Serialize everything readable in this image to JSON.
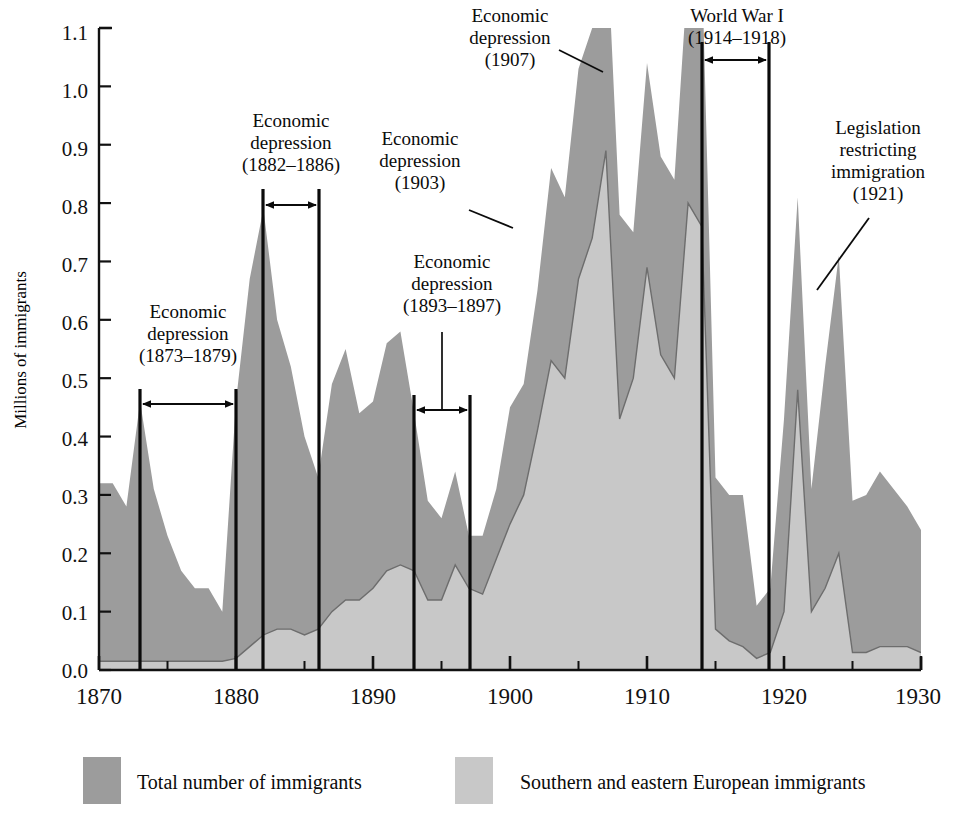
{
  "chart_data": {
    "type": "area",
    "title": "",
    "xlabel": "",
    "ylabel": "Millions of immigrants",
    "xlim": [
      1870,
      1930
    ],
    "ylim": [
      0.0,
      1.1
    ],
    "grid": false,
    "legend_position": "bottom",
    "y_ticks": [
      "0.0",
      "0.1",
      "0.2",
      "0.3",
      "0.4",
      "0.5",
      "0.6",
      "0.7",
      "0.8",
      "0.9",
      "1.0",
      "1.1"
    ],
    "x_ticks": [
      "1870",
      "1880",
      "1890",
      "1900",
      "1910",
      "1920",
      "1930"
    ],
    "x_minor_tick_interval": 5,
    "x": [
      1870,
      1871,
      1872,
      1873,
      1874,
      1875,
      1876,
      1877,
      1878,
      1879,
      1880,
      1881,
      1882,
      1883,
      1884,
      1885,
      1886,
      1887,
      1888,
      1889,
      1890,
      1891,
      1892,
      1893,
      1894,
      1895,
      1896,
      1897,
      1898,
      1899,
      1900,
      1901,
      1902,
      1903,
      1904,
      1905,
      1906,
      1907,
      1908,
      1909,
      1910,
      1911,
      1912,
      1913,
      1914,
      1915,
      1916,
      1917,
      1918,
      1919,
      1920,
      1921,
      1922,
      1923,
      1924,
      1925,
      1926,
      1927,
      1928,
      1929,
      1930
    ],
    "series": [
      {
        "name": "Total number of immigrants",
        "color": "#9c9c9c",
        "values": [
          0.32,
          0.32,
          0.28,
          0.46,
          0.31,
          0.23,
          0.17,
          0.14,
          0.14,
          0.1,
          0.46,
          0.67,
          0.79,
          0.6,
          0.52,
          0.4,
          0.33,
          0.49,
          0.55,
          0.44,
          0.46,
          0.56,
          0.58,
          0.44,
          0.29,
          0.26,
          0.34,
          0.23,
          0.23,
          0.31,
          0.45,
          0.49,
          0.65,
          0.86,
          0.81,
          1.03,
          1.1,
          1.29,
          0.78,
          0.75,
          1.04,
          0.88,
          0.84,
          1.2,
          1.22,
          0.33,
          0.3,
          0.3,
          0.11,
          0.14,
          0.43,
          0.81,
          0.31,
          0.52,
          0.71,
          0.29,
          0.3,
          0.34,
          0.31,
          0.28,
          0.24
        ]
      },
      {
        "name": "Southern and eastern European immigrants",
        "color": "#c8c8c8",
        "values": [
          0.015,
          0.015,
          0.015,
          0.015,
          0.015,
          0.015,
          0.015,
          0.015,
          0.015,
          0.015,
          0.02,
          0.04,
          0.06,
          0.07,
          0.07,
          0.06,
          0.07,
          0.1,
          0.12,
          0.12,
          0.14,
          0.17,
          0.18,
          0.17,
          0.12,
          0.12,
          0.18,
          0.14,
          0.13,
          0.19,
          0.25,
          0.3,
          0.41,
          0.53,
          0.5,
          0.67,
          0.74,
          0.89,
          0.43,
          0.5,
          0.69,
          0.54,
          0.5,
          0.8,
          0.76,
          0.07,
          0.05,
          0.04,
          0.02,
          0.03,
          0.1,
          0.48,
          0.1,
          0.14,
          0.2,
          0.03,
          0.03,
          0.04,
          0.04,
          0.04,
          0.03
        ]
      }
    ],
    "annotations": [
      {
        "id": "depression-1873-1879",
        "lines": [
          "Economic",
          "depression",
          "(1873–1879)"
        ],
        "marker": "span-arrow",
        "span_start": 1873,
        "span_end": 1879,
        "span_top": 0.5
      },
      {
        "id": "depression-1882-1886",
        "lines": [
          "Economic",
          "depression",
          "(1882–1886)"
        ],
        "marker": "span-arrow",
        "span_start": 1882,
        "span_end": 1886,
        "span_top": 0.845
      },
      {
        "id": "depression-1893-1897",
        "lines": [
          "Economic",
          "depression",
          "(1893–1897)"
        ],
        "marker": "span-arrow",
        "span_start": 1893,
        "span_end": 1897,
        "span_top": 0.49
      },
      {
        "id": "depression-1903",
        "lines": [
          "Economic",
          "depression",
          "(1903)"
        ],
        "marker": "leader-line",
        "point_year": 1903
      },
      {
        "id": "depression-1907",
        "lines": [
          "Economic",
          "depression",
          "(1907)"
        ],
        "marker": "leader-line",
        "point_year": 1907
      },
      {
        "id": "world-war-i",
        "lines": [
          "World War I",
          "(1914–1918)"
        ],
        "marker": "span-arrow",
        "span_start": 1914,
        "span_end": 1918,
        "span_top": 1.035
      },
      {
        "id": "legislation-1921",
        "lines": [
          "Legislation",
          "restricting",
          "immigration",
          "(1921)"
        ],
        "marker": "leader-line",
        "point_year": 1921
      }
    ]
  },
  "axis": {
    "y_title": "Millions of immigrants",
    "y_tick_0": "0.0",
    "y_tick_1": "0.1",
    "y_tick_2": "0.2",
    "y_tick_3": "0.3",
    "y_tick_4": "0.4",
    "y_tick_5": "0.5",
    "y_tick_6": "0.6",
    "y_tick_7": "0.7",
    "y_tick_8": "0.8",
    "y_tick_9": "0.9",
    "y_tick_10": "1.0",
    "y_tick_11": "1.1",
    "x_tick_0": "1870",
    "x_tick_1": "1880",
    "x_tick_2": "1890",
    "x_tick_3": "1900",
    "x_tick_4": "1910",
    "x_tick_5": "1920",
    "x_tick_6": "1930"
  },
  "annotations": {
    "a1_l1": "Economic",
    "a1_l2": "depression",
    "a1_l3": "(1873–1879)",
    "a2_l1": "Economic",
    "a2_l2": "depression",
    "a2_l3": "(1882–1886)",
    "a3_l1": "Economic",
    "a3_l2": "depression",
    "a3_l3": "(1893–1897)",
    "a4_l1": "Economic",
    "a4_l2": "depression",
    "a4_l3": "(1903)",
    "a5_l1": "Economic",
    "a5_l2": "depression",
    "a5_l3": "(1907)",
    "a6_l1": "World War I",
    "a6_l2": "(1914–1918)",
    "a7_l1": "Legislation",
    "a7_l2": "restricting",
    "a7_l3": "immigration",
    "a7_l4": "(1921)"
  },
  "legend": {
    "item1_label": "Total number of immigrants",
    "item1_color": "#9c9c9c",
    "item2_label": "Southern and eastern European immigrants",
    "item2_color": "#c8c8c8"
  }
}
